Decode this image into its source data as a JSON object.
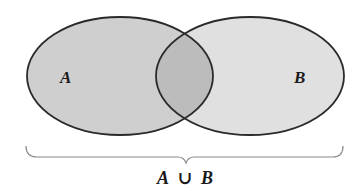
{
  "diagram": {
    "type": "venn-diagram",
    "sets": [
      {
        "id": "A",
        "label": "A",
        "fill": "#cfcfcf"
      },
      {
        "id": "B",
        "label": "B",
        "fill": "#e0e0e0"
      }
    ],
    "intersection": {
      "fill": "#bcbcbc"
    },
    "outline_color": "#2a2a2a",
    "brace": {
      "color": "#8a8a8a",
      "label": {
        "left": "A",
        "operator": "∪",
        "right": "B"
      }
    }
  }
}
